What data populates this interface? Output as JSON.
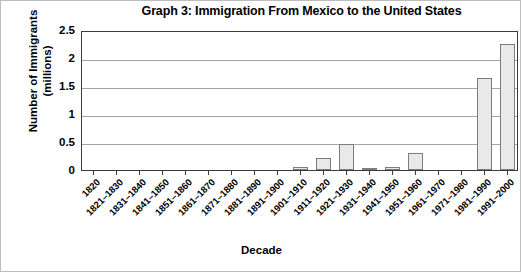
{
  "chart_data": {
    "type": "bar",
    "title": "Graph 3: Immigration From Mexico to the United States",
    "xlabel": "Decade",
    "ylabel": "Number of Immigrants\n(millions)",
    "ylabel_line1": "Number of Immigrants",
    "ylabel_line2": "(millions)",
    "ylim": [
      0,
      2.5
    ],
    "yticks": [
      "0",
      "0.5",
      "1",
      "1.5",
      "2",
      "2.5"
    ],
    "ytick_values": [
      0,
      0.5,
      1,
      1.5,
      2,
      2.5
    ],
    "grid": true,
    "legend": "none",
    "bar_fill": "#e9e9e9",
    "bar_border": "#7d7d7d",
    "categories": [
      "1820",
      "1821–1830",
      "1831–1840",
      "1841–1850",
      "1851–1860",
      "1861–1870",
      "1871–1880",
      "1881–1890",
      "1891–1900",
      "1901–1910",
      "1911–1920",
      "1921–1930",
      "1931–1940",
      "1941–1950",
      "1951–1960",
      "1961–1970",
      "1971–1980",
      "1981–1990",
      "1991–2000"
    ],
    "values": [
      0,
      0,
      0,
      0,
      0,
      0,
      0,
      0,
      0,
      0.05,
      0.22,
      0.46,
      0.02,
      0.06,
      0.3,
      0,
      0,
      1.65,
      2.25
    ]
  }
}
